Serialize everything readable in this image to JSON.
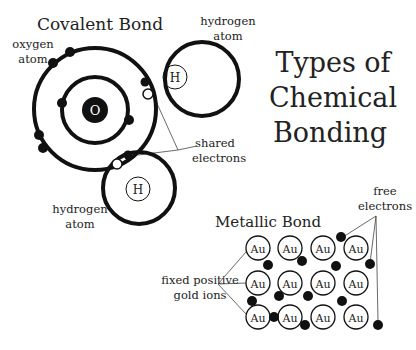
{
  "title": {
    "lines": [
      "Types of",
      "Chemical",
      "Bonding"
    ]
  },
  "covalent": {
    "heading": "Covalent Bond",
    "oxygen_label": [
      "oxygen",
      "atom"
    ],
    "oxygen_symbol": "O",
    "hydrogen_top_label": [
      "hydrogen",
      "atom"
    ],
    "hydrogen_bottom_label": [
      "hydrogen",
      "atom"
    ],
    "hydrogen_symbol": "H",
    "shared_label": [
      "shared",
      "electrons"
    ]
  },
  "metallic": {
    "heading": "Metallic Bond",
    "ion_symbol": "Au",
    "ions_label": [
      "fixed positive",
      "gold ions"
    ],
    "free_label": [
      "free",
      "electrons"
    ],
    "grid_rows": 3,
    "grid_cols": 4
  },
  "colors": {
    "ink": "#111111",
    "text": "#222222",
    "background": "#ffffff"
  }
}
